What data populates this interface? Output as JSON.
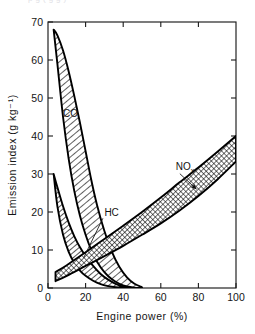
{
  "figure": {
    "top_caption_fragment": "p g         ( g g )",
    "background_color": "#ffffff",
    "ink_color": "#000000"
  },
  "chart_data": {
    "type": "area",
    "title": "",
    "subtitle": "",
    "xlabel": "Engine power (%)",
    "ylabel": "Emission index (g kg⁻¹)",
    "xlim": [
      0,
      100
    ],
    "ylim": [
      0,
      70
    ],
    "xticks": [
      0,
      20,
      40,
      60,
      80,
      100
    ],
    "yticks": [
      0,
      10,
      20,
      30,
      40,
      50,
      60,
      70
    ],
    "xticklabels": [
      "0",
      "20",
      "40",
      "60",
      "80",
      "100"
    ],
    "yticklabels": [
      "0",
      "10",
      "20",
      "30",
      "40",
      "50",
      "60",
      "70"
    ],
    "grid": false,
    "legend_position": "inline-annotations",
    "series": [
      {
        "name": "CO",
        "label": "CO",
        "style": "hatched-band-diagonal",
        "hatch": "forward-diagonal",
        "label_x": 8,
        "label_y": 45,
        "x": [
          3,
          5,
          8,
          11,
          14,
          17,
          20,
          23,
          26,
          30,
          34,
          38,
          42,
          46,
          50
        ],
        "upper": [
          68,
          66.5,
          62.5,
          57,
          50.5,
          43.5,
          36,
          28.5,
          22,
          15,
          9.5,
          5.5,
          2.8,
          1.1,
          0.2
        ],
        "lower": [
          68,
          59,
          45,
          34,
          25.5,
          19,
          14,
          10,
          7,
          4.2,
          2.3,
          1.1,
          0.4,
          0.1,
          0.0
        ]
      },
      {
        "name": "HC",
        "label": "HC",
        "style": "hatched-band-diagonal",
        "hatch": "forward-diagonal",
        "label_x": 30,
        "label_y": 19,
        "leader_to_x": 19,
        "leader_to_y": 8,
        "x": [
          3,
          5,
          8,
          11,
          14,
          17,
          20,
          24,
          28,
          32,
          36,
          40,
          43
        ],
        "upper": [
          30,
          26.5,
          21.5,
          17.2,
          13.6,
          10.7,
          8.4,
          5.8,
          3.7,
          2.2,
          1.1,
          0.35,
          0.05
        ],
        "lower": [
          30,
          21.5,
          14.0,
          9.5,
          6.6,
          4.6,
          3.2,
          1.9,
          1.0,
          0.5,
          0.2,
          0.05,
          0.0
        ]
      },
      {
        "name": "NOx",
        "label": "NO",
        "label_subscript": "x",
        "style": "hatched-band-crosshatch",
        "hatch": "cross-diagonal",
        "label_x": 68,
        "label_y": 31,
        "leader_to_x": 79,
        "leader_to_y": 26,
        "x": [
          4,
          10,
          20,
          30,
          40,
          50,
          60,
          70,
          80,
          90,
          100
        ],
        "upper": [
          4.2,
          6.0,
          9.4,
          12.9,
          16.4,
          20.0,
          23.8,
          27.8,
          31.7,
          35.8,
          40.0
        ],
        "lower": [
          1.8,
          3.2,
          5.8,
          8.4,
          11.1,
          14.0,
          17.0,
          20.4,
          24.2,
          28.5,
          33.3
        ]
      }
    ]
  }
}
